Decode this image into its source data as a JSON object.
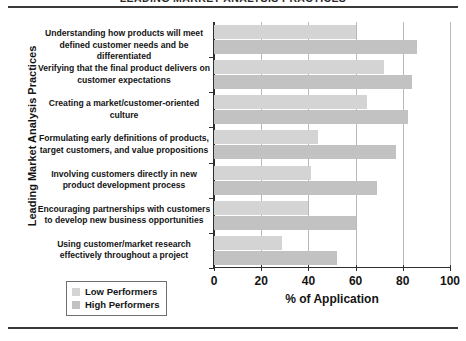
{
  "chart_data": {
    "type": "bar",
    "orientation": "horizontal",
    "title": "LEADING MARKET ANALYSIS PRACTICES",
    "xlabel": "% of Application",
    "ylabel": "Leading Market Analysis Practices",
    "xlim": [
      0,
      100
    ],
    "xticks": [
      0,
      20,
      40,
      60,
      80,
      100
    ],
    "grid": true,
    "grid_axis": "x",
    "legend_position": "bottom-left",
    "categories": [
      "Understanding how products will meet defined customer needs and be differentiated",
      "Verifying that the final product delivers on customer expectations",
      "Creating a market/customer-oriented culture",
      "Formulating early definitions of products, target customers, and value propositions",
      "Involving customers directly in new product development process",
      "Encouraging partnerships with customers to develop new business opportunities",
      "Using customer/market research effectively throughout a project"
    ],
    "series": [
      {
        "name": "Low Performers",
        "color": "#d4d4d4",
        "values": [
          60,
          72,
          65,
          44,
          41,
          40,
          29
        ]
      },
      {
        "name": "High Performers",
        "color": "#c2c2c2",
        "values": [
          86,
          84,
          82,
          77,
          69,
          60,
          52
        ]
      }
    ]
  },
  "legend": {
    "items": [
      {
        "label": "Low Performers"
      },
      {
        "label": "High Performers"
      }
    ]
  }
}
